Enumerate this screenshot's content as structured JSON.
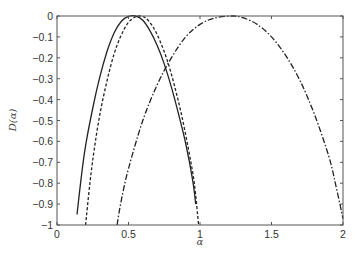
{
  "chart_data": {
    "type": "line",
    "title": "",
    "xlabel": "α",
    "ylabel": "D(α)",
    "xlim": [
      0,
      2
    ],
    "ylim": [
      -1,
      0
    ],
    "grid": false,
    "legend": null,
    "xticks": [
      0,
      0.5,
      1,
      1.5,
      2
    ],
    "xtick_labels": [
      "0",
      "0.5",
      "1",
      "1.5",
      "2"
    ],
    "yticks": [
      0,
      -0.1,
      -0.2,
      -0.3,
      -0.4,
      -0.5,
      -0.6,
      -0.7,
      -0.8,
      -0.9,
      -1
    ],
    "ytick_labels": [
      "0",
      "−0.1",
      "−0.2",
      "−0.3",
      "−0.4",
      "−0.5",
      "−0.6",
      "−0.7",
      "−0.8",
      "−0.9",
      "−1"
    ],
    "series": [
      {
        "name": "solid",
        "style": "solid",
        "color": "#222222",
        "x": [
          0.14,
          0.17,
          0.2,
          0.25,
          0.3,
          0.35,
          0.4,
          0.45,
          0.5,
          0.55,
          0.6,
          0.65,
          0.7,
          0.75,
          0.8,
          0.85,
          0.9,
          0.95,
          0.97
        ],
        "y": [
          -0.95,
          -0.77,
          -0.62,
          -0.44,
          -0.29,
          -0.17,
          -0.08,
          -0.025,
          -0.002,
          0.0,
          -0.02,
          -0.07,
          -0.14,
          -0.23,
          -0.34,
          -0.47,
          -0.61,
          -0.79,
          -0.9
        ]
      },
      {
        "name": "dashed",
        "style": "dashed",
        "color": "#222222",
        "x": [
          0.2,
          0.23,
          0.26,
          0.3,
          0.35,
          0.4,
          0.45,
          0.5,
          0.55,
          0.58,
          0.62,
          0.67,
          0.72,
          0.77,
          0.82,
          0.87,
          0.92,
          0.96,
          0.99
        ],
        "y": [
          -1.0,
          -0.8,
          -0.64,
          -0.47,
          -0.31,
          -0.18,
          -0.09,
          -0.03,
          -0.004,
          0.0,
          -0.01,
          -0.05,
          -0.12,
          -0.21,
          -0.33,
          -0.47,
          -0.64,
          -0.8,
          -1.0
        ]
      },
      {
        "name": "dash-dot",
        "style": "dashdot",
        "color": "#222222",
        "x": [
          0.42,
          0.45,
          0.5,
          0.6,
          0.7,
          0.8,
          0.9,
          1.0,
          1.1,
          1.22,
          1.3,
          1.4,
          1.5,
          1.6,
          1.7,
          1.8,
          1.9,
          1.95,
          2.0
        ],
        "y": [
          -1.0,
          -0.88,
          -0.73,
          -0.5,
          -0.33,
          -0.2,
          -0.1,
          -0.04,
          -0.01,
          0.0,
          -0.008,
          -0.04,
          -0.1,
          -0.19,
          -0.31,
          -0.47,
          -0.67,
          -0.81,
          -0.97
        ]
      }
    ]
  }
}
